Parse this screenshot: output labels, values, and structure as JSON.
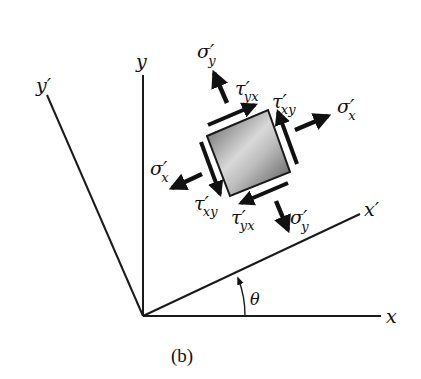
{
  "figure": {
    "caption": "(b)",
    "axes": {
      "x": "x",
      "y": "y",
      "x_prime": "x′",
      "y_prime": "y′"
    },
    "angle_label": "θ",
    "stress_labels": {
      "sigma_x_right": {
        "sym": "σ′",
        "sub": "x"
      },
      "sigma_x_left": {
        "sym": "σ′",
        "sub": "x"
      },
      "sigma_y_top": {
        "sym": "σ′",
        "sub": "y"
      },
      "sigma_y_bottom": {
        "sym": "σ′",
        "sub": "y"
      },
      "tau_yx_top": {
        "sym": "τ′",
        "sub": "yx"
      },
      "tau_xy_right": {
        "sym": "τ′",
        "sub": "xy"
      },
      "tau_xy_left": {
        "sym": "τ′",
        "sub": "xy"
      },
      "tau_yx_bottom": {
        "sym": "τ′",
        "sub": "yx"
      }
    },
    "colors": {
      "line": "#1a1a1a",
      "element_light": "#e8e8e8",
      "element_dark": "#6a6a6a"
    }
  }
}
